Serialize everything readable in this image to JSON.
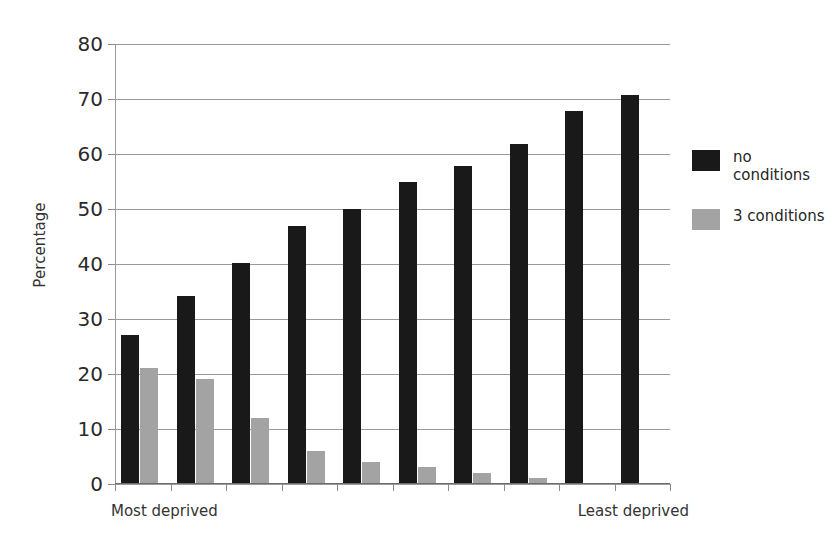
{
  "chart_data": {
    "type": "bar",
    "title": "",
    "subtitle": "",
    "xlabel": "",
    "ylabel": "Percentage",
    "ylim": [
      0,
      80
    ],
    "yticks": [
      0,
      10,
      20,
      30,
      40,
      50,
      60,
      70,
      80
    ],
    "ytick_labels": [
      "0",
      "10",
      "20",
      "30",
      "40",
      "50",
      "60",
      "70",
      "80"
    ],
    "grid": true,
    "legend_position": "right",
    "categories": [
      "1",
      "2",
      "3",
      "4",
      "5",
      "6",
      "7",
      "8",
      "9",
      "10"
    ],
    "x_axis_endpoint_labels": {
      "left": "Most deprived",
      "right": "Least deprived"
    },
    "series": [
      {
        "name": "no\nconditions",
        "legend_label": "no\nconditions",
        "color": "#191919",
        "values": [
          27.0,
          34.0,
          40.0,
          46.7,
          49.8,
          54.8,
          57.7,
          61.7,
          67.6,
          70.6
        ]
      },
      {
        "name": "3 conditions",
        "legend_label": "3 conditions",
        "color": "#a3a3a3",
        "values": [
          20.9,
          18.9,
          11.8,
          5.9,
          3.8,
          2.9,
          1.8,
          0.9,
          0.0,
          0.0
        ]
      }
    ]
  },
  "axis": {
    "y_title": "Percentage"
  },
  "legend": {
    "items": [
      {
        "label": "no\nconditions",
        "color": "#191919"
      },
      {
        "label": "3 conditions",
        "color": "#a3a3a3"
      }
    ]
  }
}
